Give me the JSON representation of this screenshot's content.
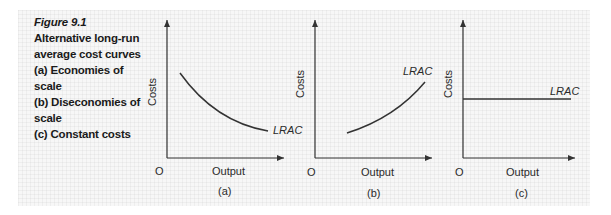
{
  "caption": {
    "figure_label": "Figure 9.1",
    "lines": [
      "Alternative long-run",
      "average cost curves",
      "(a) Economies of scale",
      "(b) Diseconomies of",
      "scale",
      "(c) Constant costs"
    ]
  },
  "panels": [
    {
      "id": "a",
      "sublabel": "(a)",
      "origin_label": "O",
      "x_axis_label": "Output",
      "y_axis_label": "Costs",
      "curve_label": "LRAC",
      "curve_shape": "downward-sloping (economies of scale)"
    },
    {
      "id": "b",
      "sublabel": "(b)",
      "origin_label": "O",
      "x_axis_label": "Output",
      "y_axis_label": "Costs",
      "curve_label": "LRAC",
      "curve_shape": "upward-sloping (diseconomies of scale)"
    },
    {
      "id": "c",
      "sublabel": "(c)",
      "origin_label": "O",
      "x_axis_label": "Output",
      "y_axis_label": "Costs",
      "curve_label": "LRAC",
      "curve_shape": "horizontal (constant costs)"
    }
  ],
  "colors": {
    "line": "#333333",
    "text": "#1a1a1a",
    "background": "#f7f7f7"
  }
}
